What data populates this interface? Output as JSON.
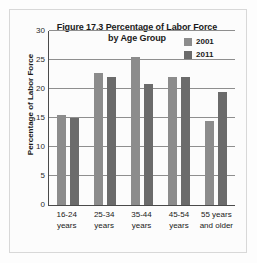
{
  "figure": {
    "title": "Figure 17.3 Percentage of Labor Force by Age Group",
    "title_line1": "Figure 17.3 Percentage of Labor Force",
    "title_line2": "by Age Group"
  },
  "legend": {
    "position": "top-right",
    "entries": [
      {
        "label": "2001",
        "color": "#8c8c8c"
      },
      {
        "label": "2011",
        "color": "#6b6b6b"
      }
    ]
  },
  "axes": {
    "y_title": "Percentage of Labor Force",
    "y_ticks": [
      "0",
      "5",
      "10",
      "15",
      "20",
      "25",
      "30"
    ],
    "x_labels": [
      {
        "line1": "16-24",
        "line2": "years"
      },
      {
        "line1": "25-34",
        "line2": "years"
      },
      {
        "line1": "35-44",
        "line2": "years"
      },
      {
        "line1": "45-54",
        "line2": "years"
      },
      {
        "line1": "55 years",
        "line2": "and older"
      }
    ]
  },
  "chart_data": {
    "type": "bar",
    "title": "Figure 17.3 Percentage of Labor Force by Age Group",
    "xlabel": "",
    "ylabel": "Percentage of Labor Force",
    "ylim": [
      0,
      30
    ],
    "ytick_step": 5,
    "grid": true,
    "legend_position": "top-right",
    "categories": [
      "16-24 years",
      "25-34 years",
      "35-44 years",
      "45-54 years",
      "55 years and older"
    ],
    "series": [
      {
        "name": "2001",
        "color": "#8c8c8c",
        "values": [
          15.6,
          22.8,
          25.5,
          22.0,
          14.4
        ]
      },
      {
        "name": "2011",
        "color": "#6b6b6b",
        "values": [
          15.0,
          22.0,
          20.9,
          22.0,
          19.4
        ]
      }
    ]
  }
}
